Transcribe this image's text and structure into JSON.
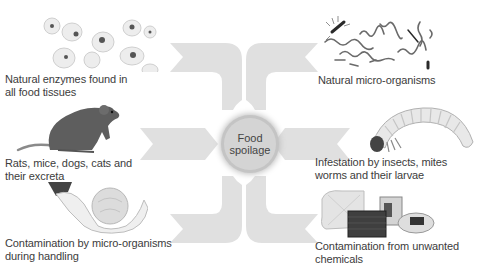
{
  "diagram": {
    "center": {
      "line1": "Food",
      "line2": "spoilage",
      "fill": "#d4d4d4"
    },
    "arrow_color": "#e0e0e0",
    "causes": [
      {
        "id": "enzymes",
        "side": "left",
        "line1": "Natural enzymes found in",
        "line2": "all food tissues",
        "icon": "cells-icon"
      },
      {
        "id": "rodents",
        "side": "left",
        "line1": "Rats, mice, dogs, cats and",
        "line2": "their excreta",
        "icon": "rat-icon"
      },
      {
        "id": "handling",
        "side": "left",
        "line1": "Contamination by micro-organisms",
        "line2": "during handling",
        "icon": "hands-holding-cabbage-icon"
      },
      {
        "id": "microorganisms",
        "side": "right",
        "line1": "Natural micro-organisms",
        "line2": "",
        "icon": "microorganisms-icon"
      },
      {
        "id": "insects",
        "side": "right",
        "line1": "Infestation by insects, mites",
        "line2": "worms and their larvae",
        "icon": "larva-icon"
      },
      {
        "id": "chemicals",
        "side": "right",
        "line1": "Contamination from unwanted",
        "line2": "chemicals",
        "icon": "chemical-containers-icon"
      }
    ]
  }
}
